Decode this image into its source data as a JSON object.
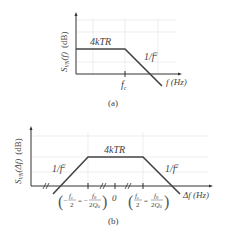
{
  "panel_a": {
    "y_label": "S",
    "y_sub": "VN",
    "y_arg": "(f)",
    "y_unit": "(dB)",
    "plateau_label": "4kTR",
    "slope_label": "1/f",
    "slope_exp": "2",
    "x_tick": "f",
    "x_tick_sub": "c",
    "x_label": "f (Hz)",
    "caption": "(a)"
  },
  "panel_b": {
    "y_label": "S",
    "y_sub": "VN",
    "y_arg": "(Δf)",
    "y_unit": "(dB)",
    "plateau_label": "4kTR",
    "left_slope_label": "1/f",
    "right_slope_label": "1/f",
    "slope_exp": "2",
    "zero_tick": "0",
    "left_tick": "−fc/2 = −f0/(2Q0)",
    "right_tick": "fc/2 = f0/(2Q0)",
    "x_label": "Δf (Hz)",
    "caption": "(b)"
  },
  "colors": {
    "axis": "#333333",
    "curve": "#444444",
    "grid": "#dddddd",
    "text": "#444444"
  }
}
